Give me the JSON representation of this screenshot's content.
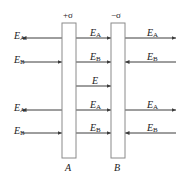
{
  "figure": {
    "type": "electric-field-parallel-plates-diagram",
    "background_color": "#ffffff",
    "line_color": "#3c3c3c",
    "text_color": "#1a1a1a"
  },
  "plates": {
    "left": {
      "name": "A",
      "label": "A",
      "charge_label": "+σ",
      "x": 62,
      "y": 23,
      "width": 14,
      "height": 135
    },
    "right": {
      "name": "B",
      "label": "B",
      "charge_label": "−σ",
      "x": 111,
      "y": 23,
      "width": 14,
      "height": 135
    }
  },
  "rows": [
    {
      "index": 1,
      "y": 38,
      "left": {
        "symbol": "E",
        "subscript": "A",
        "direction": "left",
        "label_x": 14,
        "label_y": 31
      },
      "middle": {
        "symbol": "E",
        "subscript": "A",
        "direction": "right",
        "label_x": 90,
        "label_y": 28
      },
      "right": {
        "symbol": "E",
        "subscript": "A",
        "direction": "right",
        "label_x": 147,
        "label_y": 28
      }
    },
    {
      "index": 2,
      "y": 62,
      "left": {
        "symbol": "E",
        "subscript": "B",
        "direction": "right",
        "label_x": 14,
        "label_y": 55
      },
      "middle": {
        "symbol": "E",
        "subscript": "B",
        "direction": "right",
        "label_x": 90,
        "label_y": 52
      },
      "right": {
        "symbol": "E",
        "subscript": "B",
        "direction": "left",
        "label_x": 147,
        "label_y": 52
      }
    },
    {
      "index": 3,
      "y": 86,
      "left": null,
      "middle": {
        "symbol": "E",
        "subscript": "",
        "direction": "right",
        "label_x": 92,
        "label_y": 76
      },
      "right": null
    },
    {
      "index": 4,
      "y": 110,
      "left": {
        "symbol": "E",
        "subscript": "A",
        "direction": "left",
        "label_x": 14,
        "label_y": 103
      },
      "middle": {
        "symbol": "E",
        "subscript": "A",
        "direction": "right",
        "label_x": 90,
        "label_y": 100
      },
      "right": {
        "symbol": "E",
        "subscript": "A",
        "direction": "right",
        "label_x": 147,
        "label_y": 100
      }
    },
    {
      "index": 5,
      "y": 133,
      "left": {
        "symbol": "E",
        "subscript": "B",
        "direction": "right",
        "label_x": 14,
        "label_y": 126
      },
      "middle": {
        "symbol": "E",
        "subscript": "B",
        "direction": "right",
        "label_x": 90,
        "label_y": 123
      },
      "right": {
        "symbol": "E",
        "subscript": "B",
        "direction": "left",
        "label_x": 147,
        "label_y": 123
      }
    }
  ],
  "charge_labels": {
    "left_x": 63,
    "left_y": 11,
    "right_x": 111,
    "right_y": 11
  },
  "plate_name_labels": {
    "left_x": 65,
    "left_y": 163,
    "right_x": 114,
    "right_y": 163
  }
}
